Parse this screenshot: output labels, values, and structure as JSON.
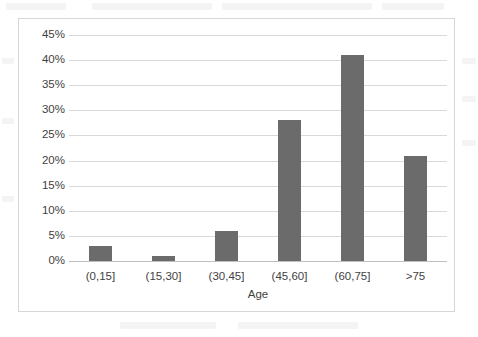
{
  "chart_data": {
    "type": "bar",
    "title": "",
    "subtitle": "",
    "xlabel": "Age",
    "ylabel": "",
    "categories": [
      "(0,15]",
      "(15,30]",
      "(30,45]",
      "(45,60]",
      "(60,75]",
      ">75"
    ],
    "values": [
      3,
      1,
      6,
      28,
      41,
      21
    ],
    "value_suffix": "%",
    "ylim": [
      0,
      45
    ],
    "ytick_values": [
      0,
      5,
      10,
      15,
      20,
      25,
      30,
      35,
      40,
      45
    ],
    "ytick_labels": [
      "0%",
      "5%",
      "10%",
      "15%",
      "20%",
      "25%",
      "30%",
      "35%",
      "40%",
      "45%"
    ],
    "grid": true,
    "grid_axis": "y",
    "legend": false,
    "legend_position": "none",
    "series": [
      {
        "name": "Percentage",
        "values": [
          3,
          1,
          6,
          28,
          41,
          21
        ],
        "color": "#6b6b6b"
      }
    ]
  },
  "style": {
    "bar_color": "#6b6b6b",
    "gridline_color": "#d9d9d9",
    "axis_line_color": "#bfbfbf",
    "frame_border_color": "#d7d7d7",
    "text_color": "#3f3f3f",
    "plot_background": "#ffffff"
  }
}
